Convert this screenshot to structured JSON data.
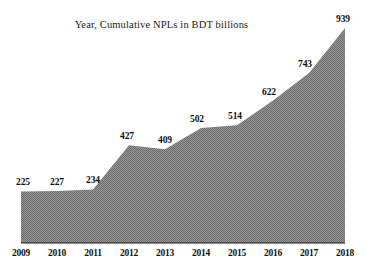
{
  "chart_data": {
    "type": "area",
    "title": "Year, Cumulative NPLs in BDT billions",
    "xlabel": "",
    "ylabel": "",
    "categories": [
      "2009",
      "2010",
      "2011",
      "2012",
      "2013",
      "2014",
      "2015",
      "2016",
      "2017",
      "2018"
    ],
    "values": [
      225,
      227,
      234,
      427,
      409,
      502,
      514,
      622,
      743,
      939
    ],
    "point_labels": [
      "225",
      "227",
      "234",
      "427",
      "409",
      "502",
      "514",
      "622",
      "743",
      "939"
    ],
    "ylim": [
      0,
      1000
    ],
    "xlim": [
      "2009",
      "2018"
    ],
    "grid": false,
    "legend": false,
    "legend_position": "none",
    "series": [
      {
        "name": "Cumulative NPLs in BDT billions",
        "values": [
          225,
          227,
          234,
          427,
          409,
          502,
          514,
          622,
          743,
          939
        ]
      }
    ],
    "style": {
      "fill_color": "#808080",
      "fill_pattern": "checkered-halftone",
      "axis_color": "#1a1a1a",
      "background": "#ffffff",
      "text_color": "#111111"
    },
    "annotations": []
  }
}
